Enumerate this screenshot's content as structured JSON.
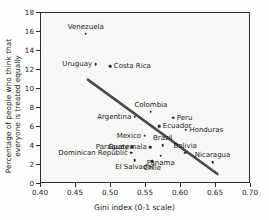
{
  "chart_data": {
    "type": "scatter",
    "title": "",
    "xlabel": "Gini index (0-1 scale)",
    "ylabel": "Percentage of people who think that everyone is treated equally",
    "xlim": [
      0.4,
      0.7
    ],
    "ylim": [
      0,
      18
    ],
    "xticks": [
      "0.40",
      "0.45",
      "0.50",
      "0.55",
      "0.60",
      "0.65",
      "0.70"
    ],
    "xtick_values": [
      0.4,
      0.45,
      0.5,
      0.55,
      0.6,
      0.65,
      0.7
    ],
    "yticks": [
      "0",
      "2",
      "4",
      "6",
      "8",
      "10",
      "12",
      "14",
      "16",
      "18"
    ],
    "ytick_values": [
      0,
      2,
      4,
      6,
      8,
      10,
      12,
      14,
      16,
      18
    ],
    "grid": false,
    "legend": "none",
    "points": [
      {
        "label": "Venezuela",
        "x": 0.464,
        "y": 15.8,
        "label_pos": "above"
      },
      {
        "label": "Uruguay",
        "x": 0.478,
        "y": 12.6,
        "label_pos": "left"
      },
      {
        "label": "Costa Rica",
        "x": 0.499,
        "y": 12.4,
        "label_pos": "right"
      },
      {
        "label": "Colombia",
        "x": 0.557,
        "y": 7.6,
        "label_pos": "above"
      },
      {
        "label": "Peru",
        "x": 0.589,
        "y": 7.0,
        "label_pos": "right"
      },
      {
        "label": "Argentina",
        "x": 0.534,
        "y": 7.1,
        "label_pos": "left"
      },
      {
        "label": "Ecuador",
        "x": 0.569,
        "y": 6.1,
        "label_pos": "right"
      },
      {
        "label": "Honduras",
        "x": 0.607,
        "y": 5.7,
        "label_pos": "right"
      },
      {
        "label": "Mexico",
        "x": 0.548,
        "y": 5.1,
        "label_pos": "left"
      },
      {
        "label": "Brazil",
        "x": 0.574,
        "y": 4.1,
        "label_pos": "above"
      },
      {
        "label": "Guatemala",
        "x": 0.556,
        "y": 3.9,
        "label_pos": "left"
      },
      {
        "label": "Paraguay",
        "x": 0.53,
        "y": 3.9,
        "label_pos": "left"
      },
      {
        "label": "Bolivia",
        "x": 0.606,
        "y": 3.3,
        "label_pos": "above"
      },
      {
        "label": "Dominican Republic",
        "x": 0.529,
        "y": 3.3,
        "label_pos": "left"
      },
      {
        "label": "Panama",
        "x": 0.571,
        "y": 3.0,
        "label_pos": "below"
      },
      {
        "label": "Nicaragua",
        "x": 0.645,
        "y": 2.3,
        "label_pos": "above"
      },
      {
        "label": "El Salvador",
        "x": 0.534,
        "y": 2.5,
        "label_pos": "below"
      },
      {
        "label": "Chile",
        "x": 0.559,
        "y": 2.4,
        "label_pos": "below"
      }
    ],
    "trendline": {
      "type": "line",
      "x_start": 0.4675,
      "y_start": 10.9,
      "x_end": 0.6545,
      "y_end": 0.85,
      "color": "#4a4a4a"
    },
    "colors": {
      "marker": "#2b2b2b",
      "axis": "#2b2b2b",
      "plot_background": "#f7f7f5",
      "text": "#1a1a1a"
    }
  }
}
